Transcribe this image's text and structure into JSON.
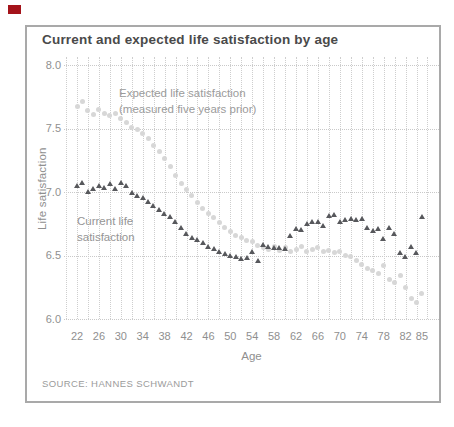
{
  "chart": {
    "title": "Current and expected life satisfaction by age",
    "y_axis_label": "Life satisfaction",
    "x_axis_label": "Age",
    "source": "SOURCE: HANNES SCHWANDT",
    "annotations": {
      "expected_line1": "Expected life satisfaction",
      "expected_line2": "(measured five years prior)",
      "current_line1": "Current life",
      "current_line2": "satisfaction"
    }
  },
  "colors": {
    "red_tab": "#a4131a",
    "grid": "#cccccc",
    "frame": "#a9a9a9",
    "expected_marker": "#d7d7d7",
    "current_marker": "#57585c",
    "axis_text": "#8f8f8f",
    "title_text": "#4a4a4a"
  },
  "chart_data": {
    "type": "scatter",
    "title": "Current and expected life satisfaction by age",
    "xlabel": "Age",
    "ylabel": "Life satisfaction",
    "xlim": [
      20,
      86
    ],
    "ylim": [
      6.0,
      8.0
    ],
    "grid": true,
    "x_tick_labels": [
      "22",
      "26",
      "30",
      "34",
      "38",
      "42",
      "46",
      "50",
      "54",
      "58",
      "62",
      "66",
      "70",
      "74",
      "78",
      "82",
      "85"
    ],
    "y_tick_labels": [
      "8.0",
      "7.5",
      "7.0",
      "6.5",
      "6.0"
    ],
    "gridline_ages_start": 20,
    "gridline_ages_end": 86,
    "gridline_age_step": 2,
    "age_min": 22,
    "age_max": 85,
    "series": [
      {
        "name": "Expected life satisfaction (measured five years prior)",
        "marker": "circle",
        "values": [
          7.67,
          7.71,
          7.64,
          7.61,
          7.65,
          7.62,
          7.6,
          7.62,
          7.58,
          7.55,
          7.51,
          7.49,
          7.46,
          7.42,
          7.37,
          7.32,
          7.26,
          7.2,
          7.13,
          7.07,
          7.02,
          6.97,
          6.92,
          6.87,
          6.83,
          6.8,
          6.76,
          6.72,
          6.69,
          6.66,
          6.64,
          6.62,
          6.61,
          6.58,
          6.56,
          6.55,
          6.57,
          6.54,
          6.56,
          6.53,
          6.55,
          6.57,
          6.53,
          6.55,
          6.56,
          6.53,
          6.54,
          6.52,
          6.53,
          6.5,
          6.49,
          6.46,
          6.43,
          6.4,
          6.38,
          6.36,
          6.42,
          6.31,
          6.29,
          6.34,
          6.25,
          6.16,
          6.13,
          6.2
        ]
      },
      {
        "name": "Current life satisfaction",
        "marker": "triangle",
        "values": [
          7.05,
          7.07,
          7.0,
          7.02,
          7.05,
          7.03,
          7.06,
          7.02,
          7.07,
          7.05,
          6.99,
          6.97,
          6.95,
          6.92,
          6.89,
          6.86,
          6.83,
          6.8,
          6.76,
          6.72,
          6.67,
          6.64,
          6.62,
          6.6,
          6.57,
          6.55,
          6.53,
          6.51,
          6.5,
          6.49,
          6.47,
          6.48,
          6.53,
          6.46,
          6.58,
          6.57,
          6.56,
          6.56,
          6.55,
          6.65,
          6.71,
          6.7,
          6.75,
          6.76,
          6.76,
          6.73,
          6.81,
          6.82,
          6.76,
          6.78,
          6.79,
          6.78,
          6.79,
          6.72,
          6.69,
          6.71,
          6.63,
          6.72,
          6.67,
          6.52,
          6.49,
          6.57,
          6.52,
          6.8
        ]
      }
    ]
  }
}
